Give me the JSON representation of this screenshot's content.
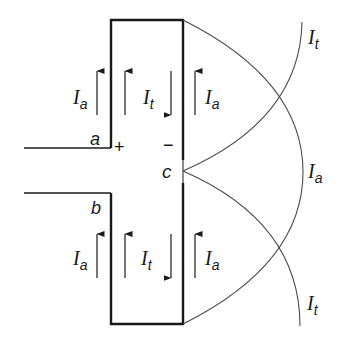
{
  "diagram": {
    "colors": {
      "stroke": "#1a1a1a",
      "curve": "#4a4a4a",
      "background": "#ffffff"
    },
    "terminals": {
      "a": "a",
      "b": "b",
      "c": "c",
      "plus": "+",
      "minus": "−"
    },
    "current_symbol": "I",
    "upper_labels": {
      "left_a": "a",
      "middle_t": "t",
      "right_a": "a"
    },
    "lower_labels": {
      "left_a": "a",
      "middle_t": "t",
      "right_a": "a"
    },
    "curve_labels": {
      "top": "t",
      "middle": "a",
      "bottom": "t"
    }
  }
}
